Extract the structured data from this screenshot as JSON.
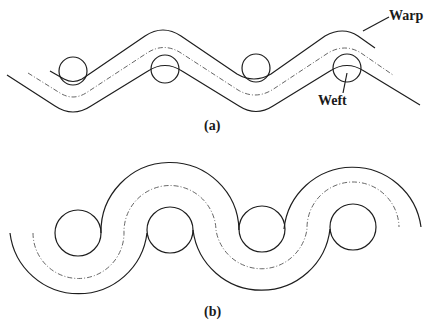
{
  "diagram_a": {
    "caption": "(a)",
    "labels": {
      "warp": "Warp",
      "weft": "Weft"
    },
    "weft_count": 4,
    "style": "zigzag warp with straight segments and rounded crowns"
  },
  "diagram_b": {
    "caption": "(b)",
    "weft_count": 4,
    "style": "sinusoidal warp formed of semicircular arcs wrapping wefts"
  },
  "colors": {
    "line": "#1e1e1e",
    "centerline": "#555555",
    "background": "#ffffff"
  }
}
